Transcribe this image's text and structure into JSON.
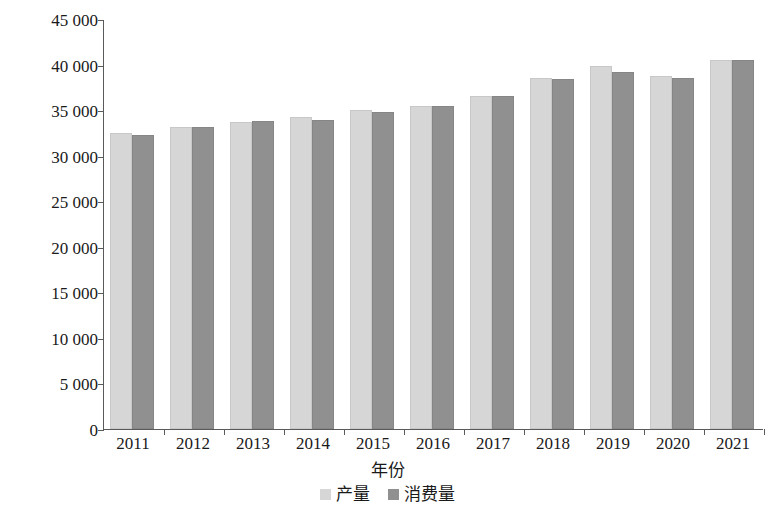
{
  "chart_data": {
    "type": "bar",
    "title": "",
    "subtitle": "",
    "xlabel": "年份",
    "ylabel": "亿立方米",
    "categories": [
      "2011",
      "2012",
      "2013",
      "2014",
      "2015",
      "2016",
      "2017",
      "2018",
      "2019",
      "2020",
      "2021"
    ],
    "series": [
      {
        "name": "产量",
        "color": "#d6d6d6",
        "values": [
          32500,
          33200,
          33700,
          34300,
          35000,
          35400,
          36600,
          38500,
          39800,
          38700,
          40500
        ]
      },
      {
        "name": "消费量",
        "color": "#909090",
        "values": [
          32300,
          33200,
          33800,
          33900,
          34800,
          35500,
          36500,
          38400,
          39200,
          38500,
          40500
        ]
      }
    ],
    "ylim": [
      0,
      45000
    ],
    "yticks": [
      0,
      5000,
      10000,
      15000,
      20000,
      25000,
      30000,
      35000,
      40000,
      45000
    ],
    "ytick_labels": [
      "0",
      "5 000",
      "10 000",
      "15 000",
      "20 000",
      "25 000",
      "30 000",
      "35 000",
      "40 000",
      "45 000"
    ],
    "grid": false,
    "legend_position": "bottom",
    "bar_orientation": "vertical"
  },
  "legend": {
    "entries": [
      {
        "label": "产量",
        "swatch": "legend-swatch-production"
      },
      {
        "label": "消费量",
        "swatch": "legend-swatch-consumption"
      }
    ]
  }
}
